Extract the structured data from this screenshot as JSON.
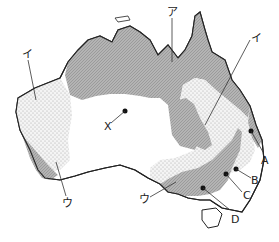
{
  "map": {
    "title": "",
    "labels": {
      "a_katakana": "ア",
      "i_west": "イ",
      "i_east": "イ",
      "u_southwest": "ウ",
      "u_south": "ウ",
      "x": "X",
      "A": "A",
      "B": "B",
      "C": "C",
      "D": "D"
    },
    "legend_zones": [
      {
        "id": "ア",
        "pattern": "hatched-gray",
        "color": "#a9a9a9"
      },
      {
        "id": "イ",
        "pattern": "dotted",
        "color": "#ececec"
      },
      {
        "id": "ウ",
        "pattern": "hatched-gray",
        "color": "#a9a9a9"
      }
    ],
    "points": [
      "X",
      "A",
      "B",
      "C",
      "D"
    ]
  }
}
